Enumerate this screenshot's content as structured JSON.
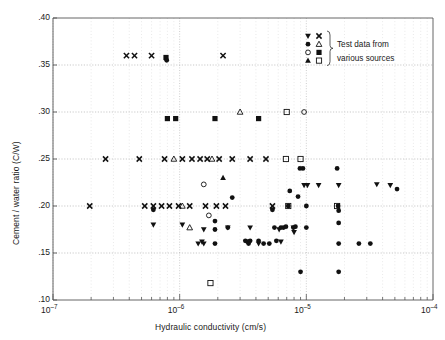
{
  "chart_data": {
    "type": "scatter",
    "title": "",
    "xlabel": "Hydraulic conductivity (cm/s)",
    "ylabel": "Cement / water ratio (C/W)",
    "xscale": "log",
    "yscale": "linear",
    "xlim": [
      1e-07,
      0.0001
    ],
    "ylim": [
      0.1,
      0.4
    ],
    "grid": true,
    "grid_style": "dotted minor log grid on x, dotted major grid on y",
    "xticklabels": [
      "10-7",
      "10-6",
      "10-5",
      "10-4"
    ],
    "xtickvalues": [
      1e-07,
      1e-06,
      1e-05,
      0.0001
    ],
    "yticklabels": [
      ".10",
      ".15",
      ".20",
      ".25",
      ".30",
      ".35",
      ".40"
    ],
    "ytickvalues": [
      0.1,
      0.15,
      0.2,
      0.25,
      0.3,
      0.35,
      0.4
    ],
    "legend": {
      "position": "top-right inside",
      "caption_line1": "Test data from",
      "caption_line2": "various sources",
      "brace": "}",
      "markers": [
        [
          "filled-down-triangle",
          "cross"
        ],
        [
          "filled-circle",
          "open-up-triangle"
        ],
        [
          "open-circle",
          "filled-square"
        ],
        [
          "filled-up-triangle",
          "open-square"
        ]
      ]
    },
    "marker_color": "#111111",
    "series": [
      {
        "name": "cross",
        "marker": "cross",
        "points": [
          [
            3.8e-07,
            0.36
          ],
          [
            4.4e-07,
            0.36
          ],
          [
            6e-07,
            0.36
          ],
          [
            2.2e-06,
            0.36
          ],
          [
            2.6e-07,
            0.25
          ],
          [
            4.8e-07,
            0.25
          ],
          [
            7.6e-07,
            0.25
          ],
          [
            1.05e-06,
            0.25
          ],
          [
            1.25e-06,
            0.25
          ],
          [
            1.45e-06,
            0.25
          ],
          [
            1.65e-06,
            0.25
          ],
          [
            2.05e-06,
            0.25
          ],
          [
            2.6e-06,
            0.25
          ],
          [
            3.6e-06,
            0.25
          ],
          [
            4.8e-06,
            0.25
          ],
          [
            1.95e-07,
            0.2
          ],
          [
            5.3e-07,
            0.2
          ],
          [
            6.2e-07,
            0.2
          ],
          [
            7.2e-07,
            0.2
          ],
          [
            8.3e-07,
            0.2
          ],
          [
            9.8e-07,
            0.2
          ],
          [
            1.2e-06,
            0.2
          ],
          [
            1.6e-06,
            0.2
          ],
          [
            1.95e-06,
            0.2
          ],
          [
            2.3e-06,
            0.2
          ],
          [
            5.4e-06,
            0.2
          ]
        ]
      },
      {
        "name": "filled-square",
        "marker": "filled-square",
        "points": [
          [
            7.8e-07,
            0.358
          ],
          [
            8e-07,
            0.293
          ],
          [
            9.3e-07,
            0.293
          ],
          [
            1.9e-06,
            0.293
          ],
          [
            4.2e-06,
            0.293
          ]
        ]
      },
      {
        "name": "open-square",
        "marker": "open-square",
        "points": [
          [
            7e-06,
            0.3
          ],
          [
            6.9e-06,
            0.25
          ],
          [
            9e-06,
            0.25
          ],
          [
            7.2e-06,
            0.2
          ],
          [
            1.75e-05,
            0.2
          ],
          [
            1.75e-06,
            0.118
          ]
        ]
      },
      {
        "name": "open-circle",
        "marker": "open-circle",
        "points": [
          [
            9.6e-06,
            0.3
          ],
          [
            1.55e-06,
            0.223
          ],
          [
            1.7e-06,
            0.19
          ]
        ]
      },
      {
        "name": "open-up-triangle",
        "marker": "open-up-triangle",
        "points": [
          [
            3e-06,
            0.3
          ],
          [
            9e-07,
            0.25
          ],
          [
            1.8e-06,
            0.25
          ],
          [
            1.05e-06,
            0.2
          ],
          [
            1.2e-06,
            0.177
          ]
        ]
      },
      {
        "name": "filled-up-triangle",
        "marker": "filled-up-triangle",
        "points": [
          [
            2.2e-06,
            0.23
          ]
        ]
      },
      {
        "name": "filled-down-triangle",
        "marker": "filled-down-triangle",
        "points": [
          [
            6.2e-07,
            0.18
          ],
          [
            1.05e-06,
            0.18
          ],
          [
            1.4e-06,
            0.16
          ],
          [
            1.5e-06,
            0.162
          ],
          [
            1.55e-06,
            0.175
          ],
          [
            1.55e-06,
            0.16
          ],
          [
            2.4e-06,
            0.177
          ],
          [
            3.6e-06,
            0.177
          ],
          [
            4.2e-06,
            0.16
          ],
          [
            6.1e-06,
            0.175
          ],
          [
            6.3e-06,
            0.162
          ],
          [
            7.9e-06,
            0.177
          ],
          [
            8e-06,
            0.172
          ],
          [
            9.6e-06,
            0.222
          ],
          [
            1.02e-05,
            0.222
          ],
          [
            1.25e-05,
            0.222
          ],
          [
            1.8e-05,
            0.222
          ],
          [
            3.6e-05,
            0.223
          ],
          [
            4.6e-05,
            0.222
          ]
        ]
      },
      {
        "name": "filled-circle",
        "marker": "filled-circle",
        "points": [
          [
            7.9e-07,
            0.355
          ],
          [
            6.2e-07,
            0.196
          ],
          [
            2.6e-06,
            0.209
          ],
          [
            1.9e-06,
            0.184
          ],
          [
            1.9e-06,
            0.175
          ],
          [
            1.9e-06,
            0.16
          ],
          [
            2.4e-06,
            0.177
          ],
          [
            3.3e-06,
            0.163
          ],
          [
            3.45e-06,
            0.162
          ],
          [
            3.5e-06,
            0.16
          ],
          [
            3.6e-06,
            0.163
          ],
          [
            4.2e-06,
            0.163
          ],
          [
            4.6e-06,
            0.16
          ],
          [
            5.1e-06,
            0.16
          ],
          [
            5.4e-06,
            0.196
          ],
          [
            5.6e-06,
            0.177
          ],
          [
            5.8e-06,
            0.163
          ],
          [
            6.3e-06,
            0.177
          ],
          [
            6.6e-06,
            0.177
          ],
          [
            6.9e-06,
            0.178
          ],
          [
            7.2e-06,
            0.2
          ],
          [
            7.4e-06,
            0.216
          ],
          [
            7.9e-06,
            0.177
          ],
          [
            8.2e-06,
            0.178
          ],
          [
            8.6e-06,
            0.21
          ],
          [
            8.9e-06,
            0.24
          ],
          [
            9.4e-06,
            0.24
          ],
          [
            9e-06,
            0.13
          ],
          [
            1e-05,
            0.2
          ],
          [
            1e-05,
            0.177
          ],
          [
            1.75e-05,
            0.24
          ],
          [
            1.78e-05,
            0.2
          ],
          [
            1.8e-05,
            0.195
          ],
          [
            1.8e-05,
            0.182
          ],
          [
            1.8e-05,
            0.16
          ],
          [
            1.8e-05,
            0.13
          ],
          [
            2.6e-05,
            0.16
          ],
          [
            3.2e-05,
            0.16
          ],
          [
            5.2e-05,
            0.218
          ]
        ]
      }
    ]
  }
}
